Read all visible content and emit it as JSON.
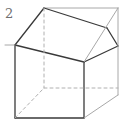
{
  "figure": {
    "label": "2",
    "label_color": "#6f6f6f",
    "caption_alt": "open cube",
    "background_color": "#ffffff",
    "solid_line_color": "#3a3a3a",
    "light_line_color": "#a8a8a8",
    "hidden_line_color": "#b0b0b0",
    "solid_line_width": "1.3",
    "light_line_width": "1",
    "hidden_line_width": "1",
    "hidden_dash_pattern": "3,3",
    "geometry": {
      "width": 123,
      "height": 125,
      "vertices": {
        "front_bottom_left": [
          15,
          118
        ],
        "front_bottom_right": [
          84,
          118
        ],
        "front_top_left": [
          15,
          45
        ],
        "front_top_right": [
          84,
          62
        ],
        "back_bottom_left": [
          44,
          88
        ],
        "back_bottom_right": [
          118,
          88
        ],
        "back_top_left": [
          44,
          8
        ],
        "back_top_right": [
          118,
          8
        ],
        "top_near_right": [
          107,
          28
        ],
        "rim_inner_right": [
          118,
          46
        ],
        "right_bottom": [
          118,
          95
        ]
      },
      "edges": [
        {
          "name": "front-left-vertical",
          "from": [
            15,
            45
          ],
          "to": [
            15,
            118
          ],
          "style": "solid"
        },
        {
          "name": "front-bottom",
          "from": [
            15,
            118
          ],
          "to": [
            84,
            118
          ],
          "style": "solid"
        },
        {
          "name": "front-right-vertical",
          "from": [
            84,
            62
          ],
          "to": [
            84,
            118
          ],
          "style": "solid"
        },
        {
          "name": "front-top-rim",
          "from": [
            15,
            45
          ],
          "to": [
            84,
            62
          ],
          "style": "solid"
        },
        {
          "name": "left-rim-diagonal",
          "from": [
            15,
            45
          ],
          "to": [
            44,
            8
          ],
          "style": "solid"
        },
        {
          "name": "top-back-edge",
          "from": [
            44,
            8
          ],
          "to": [
            118,
            8
          ],
          "style": "light"
        },
        {
          "name": "inner-back-rim",
          "from": [
            44,
            8
          ],
          "to": [
            107,
            28
          ],
          "style": "solid"
        },
        {
          "name": "right-rim-diagonal",
          "from": [
            84,
            62
          ],
          "to": [
            118,
            46
          ],
          "style": "solid"
        },
        {
          "name": "right-rim-upper",
          "from": [
            107,
            28
          ],
          "to": [
            118,
            46
          ],
          "style": "solid"
        },
        {
          "name": "top-right-diagonal",
          "from": [
            118,
            8
          ],
          "to": [
            84,
            62
          ],
          "style": "light"
        },
        {
          "name": "right-outer-vertical",
          "from": [
            118,
            8
          ],
          "to": [
            118,
            95
          ],
          "style": "light"
        },
        {
          "name": "bottom-right-diagonal",
          "from": [
            84,
            118
          ],
          "to": [
            118,
            95
          ],
          "style": "light"
        },
        {
          "name": "hidden-back-vertical",
          "from": [
            44,
            8
          ],
          "to": [
            44,
            88
          ],
          "style": "hidden"
        },
        {
          "name": "hidden-back-bottom",
          "from": [
            44,
            88
          ],
          "to": [
            118,
            88
          ],
          "style": "hidden"
        },
        {
          "name": "hidden-bottom-diagonal",
          "from": [
            15,
            118
          ],
          "to": [
            44,
            88
          ],
          "style": "hidden"
        },
        {
          "name": "top-left-corner-tick",
          "from": [
            15,
            45
          ],
          "to": [
            5,
            45
          ],
          "style": "light"
        }
      ]
    }
  }
}
